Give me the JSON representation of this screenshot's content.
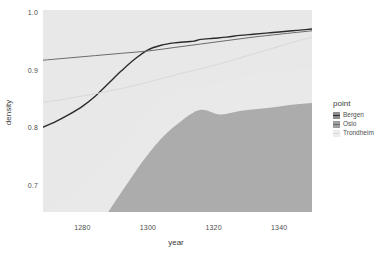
{
  "chart_data": {
    "type": "line",
    "title": "",
    "xlabel": "year",
    "ylabel": "density",
    "xlim": [
      1268,
      1350
    ],
    "ylim": [
      0.655,
      1.005
    ],
    "xticks": [
      1280,
      1300,
      1320,
      1340
    ],
    "yticks": [
      0.7,
      0.8,
      0.9,
      1.0
    ],
    "xtick_labels": [
      "1280",
      "1300",
      "1320",
      "1340"
    ],
    "ytick_labels": [
      "0.7",
      "0.8",
      "0.9",
      "1.0"
    ],
    "grid": false,
    "legend_position": "right",
    "legend_title": "point",
    "panel_background": "#ffffff",
    "series": [
      {
        "name": "Bergen",
        "color": "#2b2b2b",
        "ribbon_color": "#8c8c8c",
        "x": [
          1268,
          1272,
          1276,
          1280,
          1284,
          1288,
          1292,
          1296,
          1300,
          1304,
          1308,
          1312,
          1314,
          1316,
          1320,
          1324,
          1328,
          1332,
          1336,
          1340,
          1344,
          1348,
          1350
        ],
        "values": [
          0.802,
          0.812,
          0.824,
          0.838,
          0.856,
          0.878,
          0.9,
          0.92,
          0.936,
          0.944,
          0.948,
          0.95,
          0.951,
          0.954,
          0.956,
          0.958,
          0.961,
          0.963,
          0.965,
          0.967,
          0.969,
          0.971,
          0.972
        ],
        "ribbon_lower": [
          0.655,
          0.668,
          0.683,
          0.7,
          0.719,
          0.742,
          0.768,
          0.797,
          0.826,
          0.848,
          0.862,
          0.871,
          0.874,
          0.87,
          0.876,
          0.882,
          0.887,
          0.891,
          0.895,
          0.898,
          0.901,
          0.903,
          0.904
        ],
        "ribbon_upper": [
          1.005,
          1.005,
          1.005,
          1.005,
          1.005,
          1.005,
          1.005,
          1.005,
          1.005,
          1.005,
          1.005,
          1.005,
          1.005,
          1.005,
          1.005,
          1.005,
          1.005,
          1.005,
          1.005,
          1.005,
          1.005,
          1.005,
          1.005
        ]
      },
      {
        "name": "Oslo",
        "color": "#6b6b6b",
        "ribbon_color": "#9e9e9e",
        "x": [
          1268,
          1276,
          1284,
          1292,
          1300,
          1308,
          1316,
          1324,
          1332,
          1340,
          1350
        ],
        "values": [
          0.918,
          0.922,
          0.926,
          0.93,
          0.934,
          0.94,
          0.946,
          0.952,
          0.958,
          0.963,
          0.969
        ],
        "ribbon_lower": [
          0.655,
          0.655,
          0.655,
          0.655,
          0.655,
          0.655,
          0.655,
          0.655,
          0.655,
          0.655,
          0.655
        ],
        "ribbon_upper": [
          1.005,
          1.005,
          1.005,
          1.005,
          1.005,
          1.005,
          1.005,
          1.005,
          1.005,
          1.005,
          1.005
        ]
      },
      {
        "name": "Trondheim",
        "color": "#d9d9d9",
        "ribbon_color": "#ececec",
        "x": [
          1268,
          1274,
          1280,
          1286,
          1292,
          1298,
          1304,
          1310,
          1316,
          1322,
          1328,
          1334,
          1340,
          1346,
          1350
        ],
        "values": [
          0.845,
          0.85,
          0.856,
          0.862,
          0.869,
          0.877,
          0.886,
          0.895,
          0.903,
          0.912,
          0.922,
          0.932,
          0.942,
          0.952,
          0.958
        ],
        "ribbon_lower": [
          0.56,
          0.575,
          0.6,
          0.64,
          0.69,
          0.74,
          0.782,
          0.812,
          0.832,
          0.824,
          0.83,
          0.834,
          0.838,
          0.842,
          0.844
        ],
        "ribbon_upper": [
          1.005,
          1.005,
          1.005,
          1.005,
          1.005,
          1.005,
          1.005,
          1.005,
          1.005,
          1.005,
          1.005,
          1.005,
          1.005,
          1.005,
          1.005
        ]
      }
    ]
  }
}
